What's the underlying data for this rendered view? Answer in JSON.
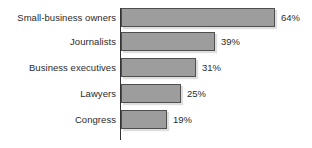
{
  "chart_data": {
    "type": "bar",
    "orientation": "horizontal",
    "title": "",
    "subtitle": "",
    "xlabel": "",
    "ylabel": "",
    "grid": false,
    "legend": false,
    "xlim": [
      0,
      64
    ],
    "categories": [
      "Small-business owners",
      "Journalists",
      "Business executives",
      "Lawyers",
      "Congress"
    ],
    "values": [
      64,
      39,
      31,
      25,
      19
    ],
    "value_labels": [
      "64%",
      "39%",
      "31%",
      "25%",
      "19%"
    ],
    "bar_fill_color": "#9d9d9d",
    "bar_border_color": "#4f4f4f",
    "axis_color": "#333333",
    "text_color": "#2b2b2b",
    "background_color": "#ffffff"
  }
}
